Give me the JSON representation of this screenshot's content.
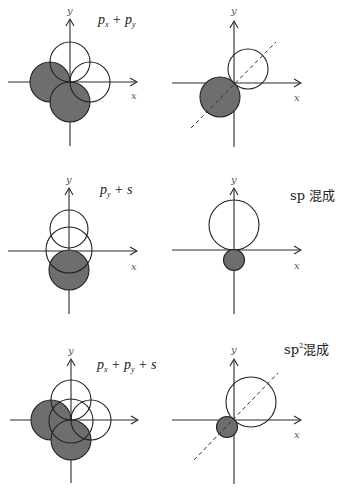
{
  "panels": [
    {
      "id": "px-plus-py",
      "label": {
        "base1": "p",
        "sub1": "x",
        "op1": " + ",
        "base2": "p",
        "sub2": "y"
      },
      "axes": {
        "x_label": "x",
        "y_label": "y"
      }
    },
    {
      "id": "px-py-hybrid",
      "axes": {
        "x_label": "x",
        "y_label": "y"
      }
    },
    {
      "id": "py-plus-s",
      "label": {
        "base1": "p",
        "sub1": "y",
        "op1": " + ",
        "s": "s"
      },
      "axes": {
        "x_label": "x",
        "y_label": "y"
      }
    },
    {
      "id": "sp-hybrid",
      "label": {
        "text": "sp 混成"
      },
      "axes": {
        "x_label": "x",
        "y_label": "y"
      }
    },
    {
      "id": "px-plus-py-plus-s",
      "label": {
        "base1": "p",
        "sub1": "x",
        "op1": " + ",
        "base2": "p",
        "sub2": "y",
        "op2": " + ",
        "s": "s"
      },
      "axes": {
        "y_label": "y"
      }
    },
    {
      "id": "sp2-hybrid",
      "label": {
        "base": "sp",
        "sup": "2",
        "suffix": "混成"
      },
      "axes": {
        "x_label": "x",
        "y_label": "y"
      }
    }
  ],
  "colors": {
    "shaded": "#6e6e6e",
    "line": "#222222",
    "background": "#ffffff"
  }
}
